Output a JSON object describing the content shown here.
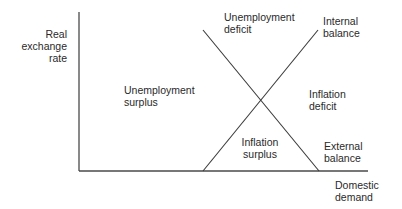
{
  "diagram": {
    "axes": {
      "y_label": "Real\nexchange\nrate",
      "x_label": "Domestic\ndemand"
    },
    "lines": [
      {
        "name": "Internal balance",
        "label": "Internal\nbalance",
        "from": [
          203,
          171
        ],
        "to": [
          318,
          30
        ]
      },
      {
        "name": "External balance",
        "label": "External\nbalance",
        "from": [
          203,
          30
        ],
        "to": [
          319,
          171
        ]
      }
    ],
    "regions": {
      "top": "Unemployment\ndeficit",
      "left": "Unemployment\nsurplus",
      "right": "Inflation\ndeficit",
      "bottom": "Inflation\nsurplus"
    },
    "colors": {
      "axis": "#4a4a4a",
      "line": "#3a3a3a",
      "text": "#2a2a2a"
    }
  }
}
